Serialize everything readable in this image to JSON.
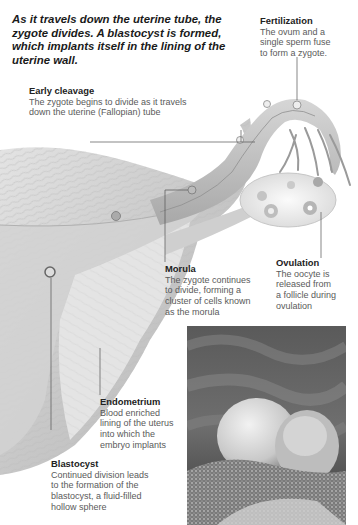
{
  "intro": {
    "text": "As it travels down the uterine tube, the zygote divides. A blastocyst is formed, which implants itself in the lining of the uterine wall."
  },
  "labels": [
    {
      "id": "fertilization",
      "title": "Fertilization",
      "lines": [
        "The ovum and a",
        "single sperm fuse",
        "to form a zygote."
      ]
    },
    {
      "id": "early-cleavage",
      "title": "Early cleavage",
      "lines": [
        "The zygote begins to divide as it travels",
        "down the uterine (Fallopian) tube"
      ]
    },
    {
      "id": "morula",
      "title": "Morula",
      "lines": [
        "The zygote continues",
        "to divide, forming a",
        "cluster of cells known",
        "as the morula"
      ]
    },
    {
      "id": "ovulation",
      "title": "Ovulation",
      "lines": [
        "The oocyte is",
        "released from",
        "a follicle during",
        "ovulation"
      ]
    },
    {
      "id": "endometrium",
      "title": "Endometrium",
      "lines": [
        "Blood enriched",
        "lining of the uterus",
        "into which the",
        "embryo implants"
      ]
    },
    {
      "id": "blastocyst",
      "title": "Blastocyst",
      "lines": [
        "Continued division leads",
        "to the formation of the",
        "blastocyst, a fluid-filled",
        "hollow sphere"
      ]
    }
  ],
  "illustration": {
    "subject": "uterus-fallopian-tube-ovary",
    "photo": "electron-micrograph-blastocyst-implanting"
  },
  "colors": {
    "tissue": "#c9c9c9",
    "tissue_dark": "#9a9a9a",
    "leader_line": "#555555",
    "text_title": "#222222",
    "text_body": "#5a5a5a"
  }
}
